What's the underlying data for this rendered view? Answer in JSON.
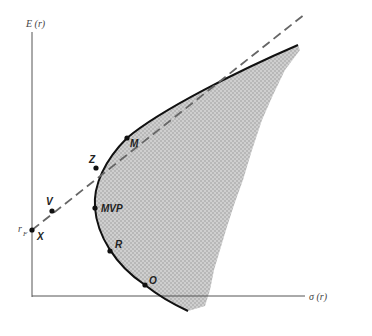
{
  "figure": {
    "y_axis_label": "E (r)",
    "x_axis_label": "σ (r)",
    "rf_label": "r",
    "rf_subscript": "F"
  },
  "points": [
    {
      "id": "X",
      "label": "X",
      "x": 32,
      "y": 230
    },
    {
      "id": "V",
      "label": "V",
      "x": 52,
      "y": 211
    },
    {
      "id": "Z",
      "label": "Z",
      "x": 96,
      "y": 168
    },
    {
      "id": "M",
      "label": "M",
      "x": 127,
      "y": 138
    },
    {
      "id": "MVP",
      "label": "MVP",
      "x": 95,
      "y": 208
    },
    {
      "id": "R",
      "label": "R",
      "x": 110,
      "y": 251
    },
    {
      "id": "O",
      "label": "O",
      "x": 145,
      "y": 285
    }
  ],
  "colors": {
    "shade": "#c4c4c4",
    "curve": "#111111",
    "axis": "#555555",
    "dashed": "#666666"
  }
}
